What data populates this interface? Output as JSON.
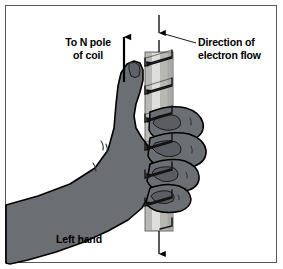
{
  "figure": {
    "border_color": "#54585c",
    "background": "#ffffff"
  },
  "labels": {
    "n_pole": "To N pole\nof coil",
    "electron_flow": "Direction of\nelectron flow",
    "left_hand": "Left hand"
  },
  "icons": {
    "thumb_arrow": "up-arrow-icon",
    "current_arrow_top": "down-arrow-icon",
    "current_arrow_bottom": "down-arrow-icon",
    "leader_line": "leader-line-icon"
  },
  "colors": {
    "hand_fill": "#6b6f73",
    "hand_outline": "#000000",
    "bar_fill": "#b7b8b3",
    "bar_highlight": "#dedfda",
    "bar_outline": "#6a6c68",
    "wire": "#1a1a1a",
    "arrow": "#000000",
    "text": "#000000"
  },
  "geometry": {
    "bar_x": 145,
    "bar_width": 28,
    "bar_top": 52,
    "bar_bottom": 231,
    "axis_x": 159,
    "coil_turns": 6
  }
}
